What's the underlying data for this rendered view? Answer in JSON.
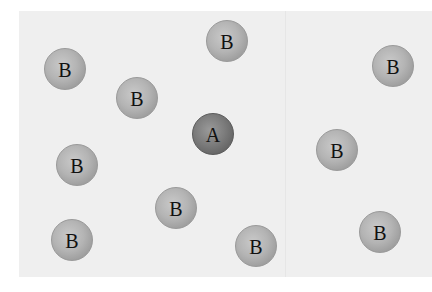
{
  "diagram": {
    "colors": {
      "background": "#efefef",
      "particle_b": "#b4b4b4",
      "particle_a": "#7c7c7c"
    },
    "particles": [
      {
        "label": "B",
        "type": "b",
        "x": 65,
        "y": 69
      },
      {
        "label": "B",
        "type": "b",
        "x": 137,
        "y": 98
      },
      {
        "label": "B",
        "type": "b",
        "x": 227,
        "y": 41
      },
      {
        "label": "A",
        "type": "a",
        "x": 213,
        "y": 134
      },
      {
        "label": "B",
        "type": "b",
        "x": 77,
        "y": 165
      },
      {
        "label": "B",
        "type": "b",
        "x": 176,
        "y": 208
      },
      {
        "label": "B",
        "type": "b",
        "x": 72,
        "y": 240
      },
      {
        "label": "B",
        "type": "b",
        "x": 256,
        "y": 246
      },
      {
        "label": "B",
        "type": "b",
        "x": 393,
        "y": 66
      },
      {
        "label": "B",
        "type": "b",
        "x": 337,
        "y": 150
      },
      {
        "label": "B",
        "type": "b",
        "x": 380,
        "y": 232
      }
    ]
  }
}
